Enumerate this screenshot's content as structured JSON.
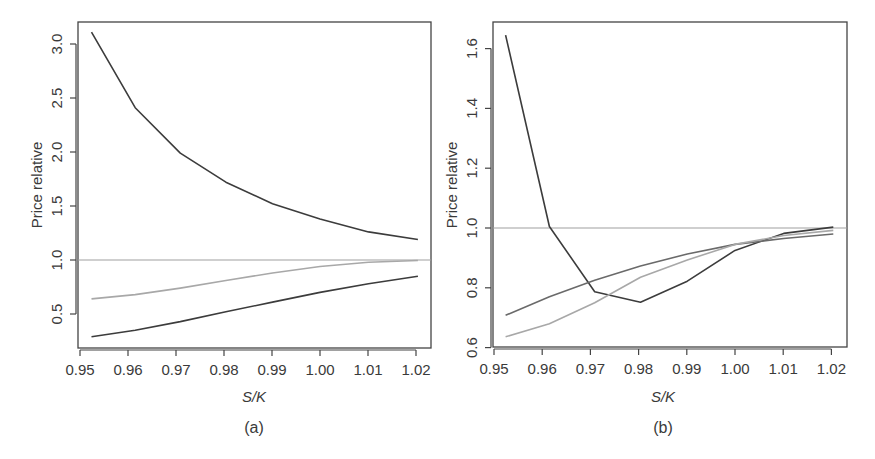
{
  "chart_data": [
    {
      "id": "a",
      "type": "line",
      "caption": "(a)",
      "title": "",
      "xlabel": "S/K",
      "ylabel": "Price relative",
      "xlim": [
        0.95,
        1.022
      ],
      "ylim": [
        0.18,
        3.2
      ],
      "xticks": [
        "0.95",
        "0.96",
        "0.97",
        "0.98",
        "0.99",
        "1.00",
        "1.01",
        "1.02"
      ],
      "yticks": [
        "0.5",
        "1.0",
        "1.5",
        "2.0",
        "2.5",
        "3.0"
      ],
      "grid": false,
      "legend": null,
      "reference_line": {
        "y": 1.0,
        "color": "#a0a0a0"
      },
      "x": [
        0.9524,
        0.9615,
        0.9709,
        0.9804,
        0.9901,
        1.0,
        1.0101,
        1.0204
      ],
      "series": [
        {
          "name": "dark-upper",
          "color": "#3c3c3c",
          "values": [
            3.11,
            2.41,
            1.99,
            1.72,
            1.52,
            1.38,
            1.26,
            1.19
          ]
        },
        {
          "name": "light-gray",
          "color": "#a8a8a8",
          "values": [
            0.64,
            0.68,
            0.74,
            0.81,
            0.88,
            0.94,
            0.98,
            0.995
          ]
        },
        {
          "name": "dark-lower",
          "color": "#3c3c3c",
          "values": [
            0.29,
            0.35,
            0.43,
            0.52,
            0.61,
            0.7,
            0.78,
            0.85
          ]
        }
      ]
    },
    {
      "id": "b",
      "type": "line",
      "caption": "(b)",
      "title": "",
      "xlabel": "S/K",
      "ylabel": "Price relative",
      "xlim": [
        0.95,
        1.022
      ],
      "ylim": [
        0.6,
        1.66
      ],
      "xticks": [
        "0.95",
        "0.96",
        "0.97",
        "0.98",
        "0.99",
        "1.00",
        "1.01",
        "1.02"
      ],
      "yticks": [
        "0.6",
        "0.8",
        "1.0",
        "1.2",
        "1.4",
        "1.6"
      ],
      "grid": false,
      "legend": null,
      "reference_line": {
        "y": 1.0,
        "color": "#a0a0a0"
      },
      "x": [
        0.9524,
        0.9615,
        0.9709,
        0.9804,
        0.9901,
        1.0,
        1.0101,
        1.0204
      ],
      "series": [
        {
          "name": "dark",
          "color": "#3c3c3c",
          "values": [
            1.645,
            1.005,
            0.787,
            0.752,
            0.822,
            0.925,
            0.982,
            1.003
          ]
        },
        {
          "name": "mid-gray",
          "color": "#6a6a6a",
          "values": [
            0.708,
            0.77,
            0.825,
            0.873,
            0.913,
            0.945,
            0.965,
            0.98
          ]
        },
        {
          "name": "light-gray",
          "color": "#a8a8a8",
          "values": [
            0.636,
            0.68,
            0.75,
            0.835,
            0.893,
            0.945,
            0.975,
            0.992
          ]
        }
      ]
    }
  ]
}
